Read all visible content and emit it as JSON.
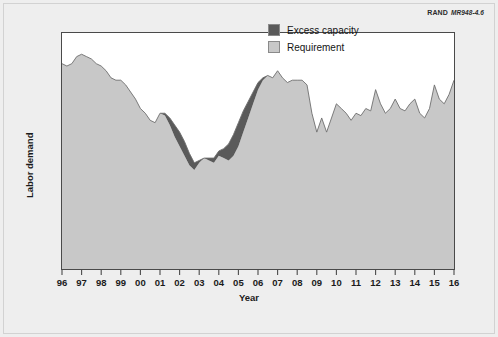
{
  "credit": {
    "org": "RAND",
    "figure_number": "MR948-4.6"
  },
  "chart_data": {
    "type": "area",
    "stacked": true,
    "title": "",
    "xlabel": "Year",
    "ylabel": "Labor demand",
    "grid": false,
    "legend_position": "top-right",
    "xlim": [
      1996,
      2016
    ],
    "ylim": [
      0,
      100
    ],
    "y_axis_ticks_shown": false,
    "x_tick_labels": [
      "96",
      "97",
      "98",
      "99",
      "00",
      "01",
      "02",
      "03",
      "04",
      "05",
      "06",
      "07",
      "08",
      "09",
      "10",
      "11",
      "12",
      "13",
      "14",
      "15",
      "16"
    ],
    "x_tick_values": [
      1996,
      1997,
      1998,
      1999,
      2000,
      2001,
      2002,
      2003,
      2004,
      2005,
      2006,
      2007,
      2008,
      2009,
      2010,
      2011,
      2012,
      2013,
      2014,
      2015,
      2016
    ],
    "colors": {
      "requirement": "#c8c8c8",
      "excess_capacity": "#5a5a5a",
      "outline": "#6e6e6e",
      "plot_background": "#ffffff",
      "figure_background": "#eeeeee",
      "axis": "#4a4a4a",
      "text": "#1b1b1b"
    },
    "series": [
      {
        "name": "Requirement",
        "color": "#c8c8c8",
        "x": [
          1996.0,
          1996.25,
          1996.5,
          1996.75,
          1997.0,
          1997.25,
          1997.5,
          1997.75,
          1998.0,
          1998.25,
          1998.5,
          1998.75,
          1999.0,
          1999.25,
          1999.5,
          1999.75,
          2000.0,
          2000.25,
          2000.5,
          2000.75,
          2001.0,
          2001.25,
          2001.5,
          2001.75,
          2002.0,
          2002.25,
          2002.5,
          2002.75,
          2003.0,
          2003.25,
          2003.5,
          2003.75,
          2004.0,
          2004.25,
          2004.5,
          2004.75,
          2005.0,
          2005.25,
          2005.5,
          2005.75,
          2006.0,
          2006.25,
          2006.5,
          2006.75,
          2007.0,
          2007.25,
          2007.5,
          2007.75,
          2008.0,
          2008.25,
          2008.5,
          2008.75,
          2009.0,
          2009.25,
          2009.5,
          2009.75,
          2010.0,
          2010.25,
          2010.5,
          2010.75,
          2011.0,
          2011.25,
          2011.5,
          2011.75,
          2012.0,
          2012.25,
          2012.5,
          2012.75,
          2013.0,
          2013.25,
          2013.5,
          2013.75,
          2014.0,
          2014.25,
          2014.5,
          2014.75,
          2015.0,
          2015.25,
          2015.5,
          2015.75,
          2016.0
        ],
        "values": [
          87,
          86,
          87,
          90,
          91,
          90,
          89,
          87,
          86,
          84,
          81,
          80,
          80,
          78,
          75,
          72,
          68,
          66,
          63,
          62,
          66,
          65,
          61,
          56,
          52,
          48,
          44,
          42,
          45,
          47,
          46,
          45,
          48,
          47,
          46,
          48,
          52,
          58,
          64,
          70,
          76,
          80,
          82,
          81,
          84,
          81,
          79,
          80,
          80,
          80,
          78,
          66,
          58,
          64,
          58,
          64,
          70,
          68,
          66,
          63,
          66,
          65,
          68,
          67,
          76,
          70,
          66,
          68,
          72,
          68,
          67,
          70,
          72,
          66,
          64,
          68,
          78,
          72,
          70,
          74,
          80
        ]
      },
      {
        "name": "Excess capacity",
        "color": "#5a5a5a",
        "x": [
          1996.0,
          1996.25,
          1996.5,
          1996.75,
          1997.0,
          1997.25,
          1997.5,
          1997.75,
          1998.0,
          1998.25,
          1998.5,
          1998.75,
          1999.0,
          1999.25,
          1999.5,
          1999.75,
          2000.0,
          2000.25,
          2000.5,
          2000.75,
          2001.0,
          2001.25,
          2001.5,
          2001.75,
          2002.0,
          2002.25,
          2002.5,
          2002.75,
          2003.0,
          2003.25,
          2003.5,
          2003.75,
          2004.0,
          2004.25,
          2004.5,
          2004.75,
          2005.0,
          2005.25,
          2005.5,
          2005.75,
          2006.0,
          2006.25,
          2006.5,
          2006.75,
          2007.0,
          2007.25,
          2007.5,
          2007.75,
          2008.0,
          2008.25,
          2008.5,
          2008.75,
          2009.0,
          2009.25,
          2009.5,
          2009.75,
          2010.0,
          2010.25,
          2010.5,
          2010.75,
          2011.0,
          2011.25,
          2011.5,
          2011.75,
          2012.0,
          2012.25,
          2012.5,
          2012.75,
          2013.0,
          2013.25,
          2013.5,
          2013.75,
          2014.0,
          2014.25,
          2014.5,
          2014.75,
          2015.0,
          2015.25,
          2015.5,
          2015.75,
          2016.0
        ],
        "values": [
          0,
          0,
          0,
          0,
          0,
          0,
          0,
          0,
          0,
          0,
          0,
          0,
          0,
          0,
          0,
          0,
          0,
          0,
          0,
          0,
          0,
          1,
          3,
          5,
          6,
          6,
          5,
          3,
          1,
          0,
          1,
          2,
          2,
          4,
          7,
          9,
          10,
          9,
          7,
          5,
          3,
          1,
          0,
          0,
          0,
          0,
          0,
          0,
          0,
          0,
          0,
          0,
          0,
          0,
          0,
          0,
          0,
          0,
          0,
          0,
          0,
          0,
          0,
          0,
          0,
          0,
          0,
          0,
          0,
          0,
          0,
          0,
          0,
          0,
          0,
          0,
          0,
          0,
          0,
          0,
          0
        ]
      }
    ],
    "legend_entries": [
      {
        "label": "Excess capacity",
        "color": "#5a5a5a"
      },
      {
        "label": "Requirement",
        "color": "#c8c8c8"
      }
    ]
  }
}
